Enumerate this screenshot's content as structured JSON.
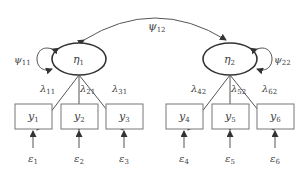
{
  "diagram": {
    "type": "structural-equation-model",
    "latent_variables": [
      {
        "id": "eta1",
        "symbol": "η",
        "sub": "1",
        "variance_label": {
          "symbol": "ψ",
          "sub": "11"
        }
      },
      {
        "id": "eta2",
        "symbol": "η",
        "sub": "2",
        "variance_label": {
          "symbol": "ψ",
          "sub": "22"
        }
      }
    ],
    "covariance": {
      "from": "eta1",
      "to": "eta2",
      "symbol": "ψ",
      "sub": "12"
    },
    "observed_variables": [
      {
        "id": "y1",
        "symbol": "y",
        "sub": "1",
        "factor": "eta1",
        "loading": {
          "symbol": "λ",
          "sub": "11"
        },
        "error": {
          "symbol": "ε",
          "sub": "1"
        }
      },
      {
        "id": "y2",
        "symbol": "y",
        "sub": "2",
        "factor": "eta1",
        "loading": {
          "symbol": "λ",
          "sub": "21"
        },
        "error": {
          "symbol": "ε",
          "sub": "2"
        }
      },
      {
        "id": "y3",
        "symbol": "y",
        "sub": "3",
        "factor": "eta1",
        "loading": {
          "symbol": "λ",
          "sub": "31"
        },
        "error": {
          "symbol": "ε",
          "sub": "3"
        }
      },
      {
        "id": "y4",
        "symbol": "y",
        "sub": "4",
        "factor": "eta2",
        "loading": {
          "symbol": "λ",
          "sub": "42"
        },
        "error": {
          "symbol": "ε",
          "sub": "4"
        }
      },
      {
        "id": "y5",
        "symbol": "y",
        "sub": "5",
        "factor": "eta2",
        "loading": {
          "symbol": "λ",
          "sub": "52"
        },
        "error": {
          "symbol": "ε",
          "sub": "5"
        }
      },
      {
        "id": "y6",
        "symbol": "y",
        "sub": "6",
        "factor": "eta2",
        "loading": {
          "symbol": "λ",
          "sub": "62"
        },
        "error": {
          "symbol": "ε",
          "sub": "6"
        }
      }
    ]
  }
}
